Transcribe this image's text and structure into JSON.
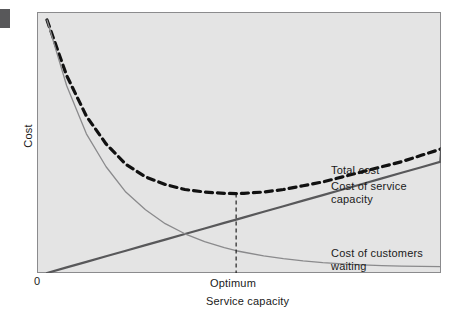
{
  "figure": {
    "background_color": "#ffffff",
    "panel_background_color": "#e4e4e4",
    "panel_border_color": "#8b8b8d"
  },
  "axes": {
    "y_label": "Cost",
    "x_label": "Service capacity",
    "origin_label": "0",
    "optimum_label": "Optimum"
  },
  "legend": {
    "total_cost": "Total cost",
    "service_capacity": "Cost of service\ncapacity",
    "customers_waiting": "Cost of customers\nwaiting"
  },
  "colors": {
    "total_cost": "#111111",
    "service_capacity": "#58585a",
    "customers_waiting": "#8a8a8c",
    "optimum_line": "#111111",
    "text": "#1a1a1a"
  },
  "chart_data": {
    "type": "line",
    "title": "",
    "subtitle": "",
    "xlabel": "Service capacity",
    "ylabel": "Cost",
    "xlim": [
      0,
      100
    ],
    "ylim": [
      0,
      100
    ],
    "grid": false,
    "legend_position": "right-inline",
    "annotations": [
      {
        "text": "Optimum",
        "x": 48,
        "y": 0,
        "type": "vertical-dashed-line",
        "note": "Dashed vertical line from x-axis up to minimum of total cost curve"
      },
      {
        "text": "0",
        "x": 0,
        "y": 0,
        "type": "origin-tick"
      }
    ],
    "x": [
      0,
      5,
      10,
      15,
      20,
      25,
      30,
      35,
      40,
      45,
      48,
      50,
      55,
      60,
      65,
      70,
      75,
      80,
      85,
      90,
      95,
      100
    ],
    "series": [
      {
        "name": "Total cost",
        "style": "dashed",
        "color": "#111111",
        "values": [
          100,
          78,
          62,
          51,
          43,
          38,
          35,
          33,
          32,
          31.5,
          31.4,
          31.5,
          32,
          33,
          34.5,
          36,
          38,
          40,
          42,
          44,
          46.5,
          49
        ]
      },
      {
        "name": "Cost of service capacity",
        "style": "solid",
        "color": "#58585a",
        "values": [
          0,
          2.2,
          4.4,
          6.6,
          8.8,
          11,
          13.2,
          15.4,
          17.6,
          19.8,
          21.1,
          22,
          24.2,
          26.4,
          28.6,
          30.8,
          33,
          35.2,
          37.4,
          39.6,
          41.8,
          44
        ]
      },
      {
        "name": "Cost of customers waiting",
        "style": "solid",
        "color": "#8a8a8c",
        "values": [
          100,
          74,
          55,
          42,
          32,
          25,
          19.5,
          15.5,
          12.4,
          10,
          8.8,
          8.2,
          6.8,
          5.7,
          4.8,
          4.1,
          3.6,
          3.2,
          2.9,
          2.7,
          2.6,
          2.5
        ]
      }
    ]
  }
}
